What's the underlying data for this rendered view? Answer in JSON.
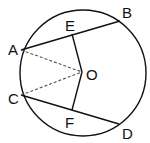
{
  "diagram": {
    "type": "circle-geometry",
    "circle": {
      "cx": 83,
      "cy": 73,
      "r": 63
    },
    "points": {
      "A": {
        "label": "A",
        "x": 21,
        "y": 50
      },
      "B": {
        "label": "B",
        "x": 120,
        "y": 21
      },
      "C": {
        "label": "C",
        "x": 21,
        "y": 95
      },
      "D": {
        "label": "D",
        "x": 119,
        "y": 124
      },
      "E": {
        "label": "E",
        "x": 72,
        "y": 34
      },
      "F": {
        "label": "F",
        "x": 72,
        "y": 110
      },
      "O": {
        "label": "O",
        "x": 82,
        "y": 72
      }
    },
    "solid_segments": [
      "AB",
      "CD",
      "EO",
      "FO"
    ],
    "dashed_segments": [
      "AO",
      "CO"
    ],
    "stroke_color": "#111111"
  }
}
